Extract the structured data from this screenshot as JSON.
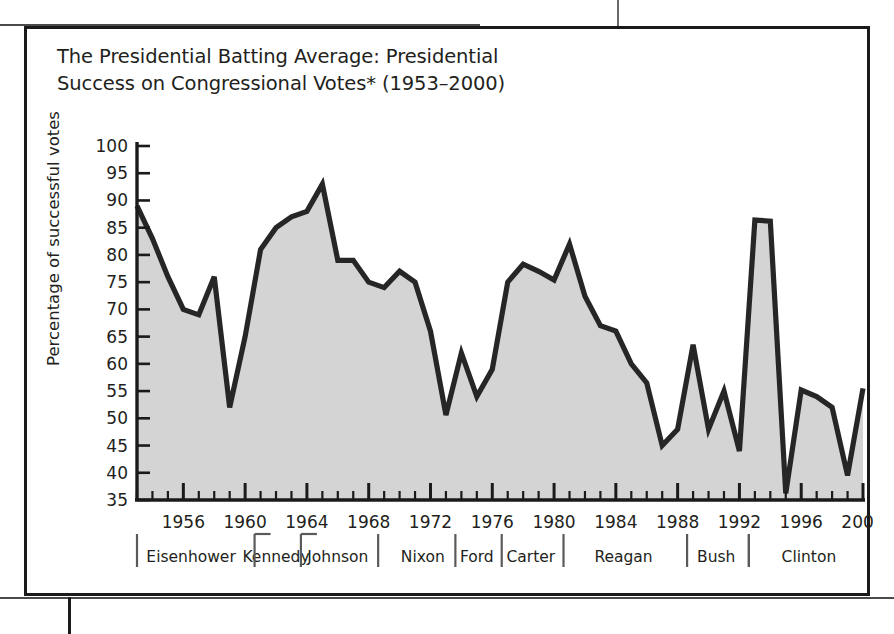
{
  "figure": {
    "title": "The Presidential Batting Average: Presidential Success on Congressional Votes* (1953–2000)"
  },
  "chart_data": {
    "type": "area",
    "title": "The Presidential Batting Average: Presidential Success on Congressional Votes* (1953–2000)",
    "xlabel": "",
    "ylabel": "Percentage of successful votes",
    "ylim": [
      35,
      100
    ],
    "xlim": [
      1953,
      2000
    ],
    "ytick_labels": [
      "100",
      "95",
      "90",
      "85",
      "80",
      "75",
      "70",
      "65",
      "60",
      "55",
      "50",
      "45",
      "40",
      "35"
    ],
    "yticks": [
      100,
      95,
      90,
      85,
      80,
      75,
      70,
      65,
      60,
      55,
      50,
      45,
      40,
      35
    ],
    "xtick_labels": [
      "1956",
      "1960",
      "1964",
      "1968",
      "1972",
      "1976",
      "1980",
      "1984",
      "1988",
      "1992",
      "1996",
      "2000"
    ],
    "xticks": [
      1956,
      1960,
      1964,
      1968,
      1972,
      1976,
      1980,
      1984,
      1988,
      1992,
      1996,
      2000
    ],
    "minor_xticks_every": 1,
    "grid": false,
    "legend": false,
    "fill_color": "#d4d4d4",
    "line_color": "#262626",
    "x": [
      1953,
      1954,
      1955,
      1956,
      1957,
      1958,
      1959,
      1960,
      1961,
      1962,
      1963,
      1964,
      1965,
      1966,
      1967,
      1968,
      1969,
      1970,
      1971,
      1972,
      1973,
      1974,
      1975,
      1976,
      1977,
      1978,
      1979,
      1980,
      1981,
      1982,
      1983,
      1984,
      1985,
      1986,
      1987,
      1988,
      1989,
      1990,
      1991,
      1992,
      1993,
      1994,
      1995,
      1996,
      1997,
      1998,
      1999,
      2000
    ],
    "values": [
      89,
      83,
      76,
      70,
      69,
      76,
      52,
      65,
      81,
      85,
      87,
      88,
      93,
      79,
      79,
      75,
      74,
      77,
      75,
      66,
      50.6,
      62,
      54,
      59,
      75,
      78.3,
      77,
      75.4,
      82,
      72.4,
      67,
      66,
      60,
      56.5,
      45,
      48,
      63.5,
      48,
      55,
      44,
      86.4,
      86.2,
      36.2,
      55.2,
      54,
      52,
      39.5,
      55.5
    ],
    "annotations": [
      {
        "label": "Eisenhower",
        "start": 1953,
        "end": 1960
      },
      {
        "label": "Kennedy",
        "start": 1961,
        "end": 1963
      },
      {
        "label": "Johnson",
        "start": 1964,
        "end": 1968
      },
      {
        "label": "Nixon",
        "start": 1969,
        "end": 1974
      },
      {
        "label": "Ford",
        "start": 1974,
        "end": 1976
      },
      {
        "label": "Carter",
        "start": 1977,
        "end": 1980
      },
      {
        "label": "Reagan",
        "start": 1981,
        "end": 1988
      },
      {
        "label": "Bush",
        "start": 1989,
        "end": 1992
      },
      {
        "label": "Clinton",
        "start": 1993,
        "end": 2000
      }
    ]
  },
  "presidents": [
    {
      "label": "Eisenhower"
    },
    {
      "label": "Kennedy"
    },
    {
      "label": "Johnson"
    },
    {
      "label": "Nixon"
    },
    {
      "label": "Ford"
    },
    {
      "label": "Carter"
    },
    {
      "label": "Reagan"
    },
    {
      "label": "Bush"
    },
    {
      "label": "Clinton"
    }
  ]
}
